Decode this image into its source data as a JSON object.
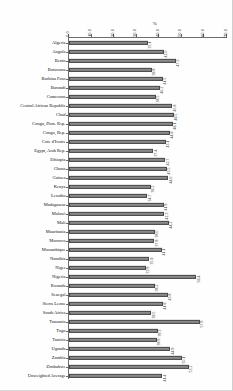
{
  "chart_data": {
    "type": "bar",
    "orientation": "horizontal",
    "title": "",
    "subtitle": "",
    "xlabel": "%",
    "ylabel": "",
    "xlim": [
      0.0,
      70.0
    ],
    "xticks": [
      "0.0",
      "10.0",
      "20.0",
      "30.0",
      "40.0",
      "50.0",
      "60.0",
      "70.0"
    ],
    "grid": false,
    "legend": false,
    "bar_color": "#8a8a8a",
    "bar_edge_color": "#4a4a4a",
    "axis_color": "#6b6b6b",
    "categories": [
      "Algeria",
      "Angola",
      "Benin",
      "Botswana",
      "Burkina Faso",
      "Burundi",
      "Cameroon",
      "Central African Republic",
      "Chad",
      "Congo, Dem. Rep.",
      "Congo, Rep.",
      "Cote d'Ivoire",
      "Egypt, Arab Rep.",
      "Ethiopia",
      "Ghana",
      "Guinea",
      "Kenya",
      "Lesotho",
      "Madagascar",
      "Malawi",
      "Mali",
      "Mauritania",
      "Morocco",
      "Mozambique",
      "Namibia",
      "Niger",
      "Nigeria",
      "Rwanda",
      "Senegal",
      "Sierra Leone",
      "South Africa",
      "Tanzania",
      "Togo",
      "Tunisia",
      "Uganda",
      "Zambia",
      "Zimbabwe",
      "Unweighted Average"
    ],
    "values": [
      35.1,
      42.0,
      47.3,
      36.8,
      41.5,
      40.2,
      38.5,
      45.8,
      46.5,
      46.1,
      44.6,
      43.1,
      37.4,
      42.7,
      43.5,
      44.0,
      36.2,
      34.7,
      41.9,
      42.3,
      44.2,
      38.0,
      37.8,
      41.1,
      35.6,
      33.9,
      56.4,
      38.2,
      43.8,
      41.6,
      36.5,
      57.9,
      39.3,
      38.9,
      44.9,
      50.1,
      53.2,
      41.4
    ],
    "value_labels": [
      "35.1",
      "42.0",
      "47.3",
      "36.8",
      "41.5",
      "40.2",
      "38.5",
      "45.8",
      "46.5",
      "46.1",
      "44.6",
      "43.1",
      "37.4",
      "42.7",
      "43.5",
      "44.0",
      "36.2",
      "34.7",
      "41.9",
      "42.3",
      "44.2",
      "38.0",
      "37.8",
      "41.1",
      "35.6",
      "33.9",
      "56.4",
      "38.2",
      "43.8",
      "41.6",
      "36.5",
      "57.9",
      "39.3",
      "38.9",
      "44.9",
      "50.1",
      "53.2",
      "41.4"
    ]
  }
}
